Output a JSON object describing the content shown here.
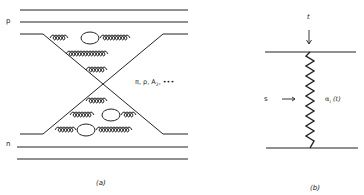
{
  "panels": {
    "a": {
      "caption": "(a)",
      "top_label": "p",
      "bottom_label": "n",
      "exchange_label": "π, ρ, A",
      "exchange_sub": "2",
      "exchange_suffix": ", •••"
    },
    "b": {
      "caption": "(b)",
      "t_label": "t",
      "s_label": "s",
      "regge_label": "α",
      "regge_sub": "i",
      "regge_arg": " (t)"
    }
  },
  "colors": {
    "ink": "#222222",
    "background": "#ffffff"
  }
}
